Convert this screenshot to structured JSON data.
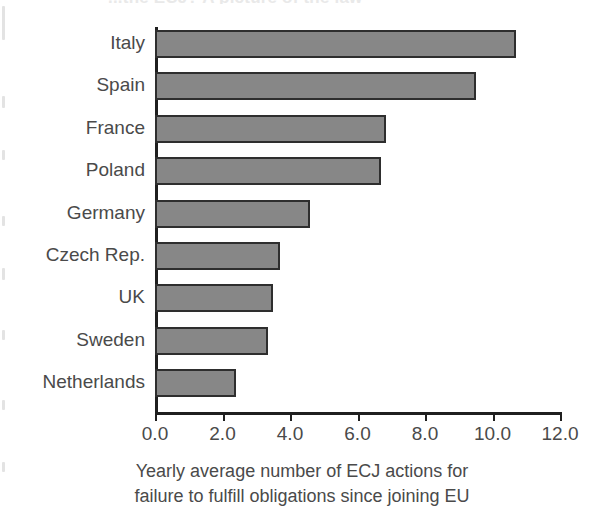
{
  "chart_data": {
    "type": "bar",
    "orientation": "horizontal",
    "title": "",
    "partial_cut_title": "...the ECJ? A picture of the law",
    "xlabel_line1": "Yearly average number of ECJ actions for",
    "xlabel_line2": "failure to fulfill obligations since joining EU",
    "ylabel": "",
    "categories": [
      "Italy",
      "Spain",
      "France",
      "Poland",
      "Germany",
      "Czech Rep.",
      "UK",
      "Sweden",
      "Netherlands"
    ],
    "values": [
      10.7,
      9.5,
      6.85,
      6.7,
      4.6,
      3.7,
      3.5,
      3.35,
      2.4
    ],
    "xlim": [
      0.0,
      12.0
    ],
    "ylim": null,
    "xticks": [
      0.0,
      2.0,
      4.0,
      6.0,
      8.0,
      10.0,
      12.0
    ],
    "xtick_labels": [
      "0.0",
      "2.0",
      "4.0",
      "6.0",
      "8.0",
      "10.0",
      "12.0"
    ],
    "grid": false,
    "legend": null,
    "legend_position": "none",
    "bar_fill_color": "#878787",
    "bar_edge_color": "#2e2e2e",
    "axis_color": "#1f1f1f",
    "text_color": "#4a4a4a",
    "background_color": "#ffffff"
  }
}
